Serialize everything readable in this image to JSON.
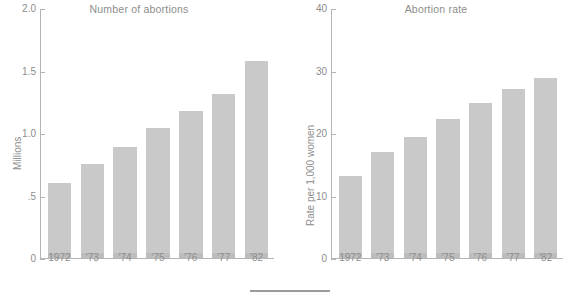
{
  "figure": {
    "width": 578,
    "height": 300,
    "background": "#ffffff",
    "bar_color": "#c9c9c9",
    "axis_color": "#b4b4b4",
    "text_color": "#8d8d8d",
    "footer_rule": "horizontal-rule"
  },
  "chart_data": [
    {
      "type": "bar",
      "title": "Number of abortions",
      "xlabel": "",
      "ylabel": "Millions",
      "categories": [
        "1972",
        "'73",
        "'74",
        "'75",
        "'76",
        "'77",
        "'82"
      ],
      "values": [
        0.6,
        0.75,
        0.89,
        1.04,
        1.18,
        1.31,
        1.58
      ],
      "ylim": [
        0,
        2.0
      ],
      "yticks": [
        0,
        0.5,
        1.0,
        1.5,
        2.0
      ],
      "ytick_labels": [
        "0",
        ".5",
        "1.0",
        "1.5",
        "2.0"
      ],
      "grid": false,
      "legend": "none"
    },
    {
      "type": "bar",
      "title": "Abortion rate",
      "xlabel": "",
      "ylabel": "Rate per 1,000 women",
      "categories": [
        "1972",
        "'73",
        "'74",
        "'75",
        "'76",
        "'77",
        "'82"
      ],
      "values": [
        13.2,
        17.0,
        19.3,
        22.2,
        24.8,
        27.0,
        28.8
      ],
      "ylim": [
        0,
        40
      ],
      "yticks": [
        0,
        10,
        20,
        30,
        40
      ],
      "ytick_labels": [
        "0",
        "10",
        "20",
        "30",
        "40"
      ],
      "grid": false,
      "legend": "none"
    }
  ]
}
